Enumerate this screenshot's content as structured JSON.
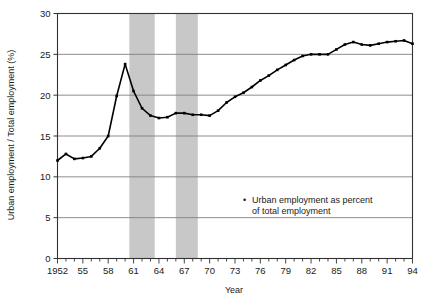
{
  "chart_data": {
    "type": "line",
    "title": "",
    "xlabel": "Year",
    "ylabel": "Urban employment / Total employment (%)",
    "xlim": [
      1952,
      1994
    ],
    "ylim": [
      0,
      30
    ],
    "grid": true,
    "ytick_labels": [
      "0",
      "5",
      "10",
      "15",
      "20",
      "25",
      "30"
    ],
    "yticks": [
      0,
      5,
      10,
      15,
      20,
      25,
      30
    ],
    "xtick_labels": [
      "1952",
      "55",
      "58",
      "61",
      "64",
      "67",
      "70",
      "73",
      "76",
      "79",
      "82",
      "85",
      "88",
      "91",
      "94"
    ],
    "xticks": [
      1952,
      1955,
      1958,
      1961,
      1964,
      1967,
      1970,
      1973,
      1976,
      1979,
      1982,
      1985,
      1988,
      1991,
      1994
    ],
    "legend_position": "inside-lower-right",
    "legend": [
      {
        "marker": "dot",
        "label_line1": "Urban employment as percent",
        "label_line2": "of total employment"
      }
    ],
    "shaded_bands": [
      {
        "start": 1960.5,
        "end": 1963.5,
        "color": "#c8c8c8"
      },
      {
        "start": 1966.0,
        "end": 1968.6,
        "color": "#c8c8c8"
      }
    ],
    "series": [
      {
        "name": "Urban employment as percent of total employment",
        "color": "#000000",
        "x": [
          1952,
          1953,
          1954,
          1955,
          1956,
          1957,
          1958,
          1959,
          1960,
          1961,
          1962,
          1963,
          1964,
          1965,
          1966,
          1967,
          1968,
          1969,
          1970,
          1971,
          1972,
          1973,
          1974,
          1975,
          1976,
          1977,
          1978,
          1979,
          1980,
          1981,
          1982,
          1983,
          1984,
          1985,
          1986,
          1987,
          1988,
          1989,
          1990,
          1991,
          1992,
          1993,
          1994
        ],
        "y": [
          12.0,
          12.8,
          12.2,
          12.3,
          12.5,
          13.5,
          15.0,
          19.9,
          23.8,
          20.5,
          18.4,
          17.5,
          17.2,
          17.3,
          17.8,
          17.8,
          17.6,
          17.6,
          17.5,
          18.1,
          19.1,
          19.8,
          20.3,
          21.0,
          21.8,
          22.4,
          23.1,
          23.7,
          24.3,
          24.8,
          25.0,
          25.0,
          25.0,
          25.6,
          26.2,
          26.5,
          26.2,
          26.1,
          26.3,
          26.5,
          26.6,
          26.7,
          26.3
        ]
      }
    ]
  },
  "legend_marker_glyph": "•"
}
